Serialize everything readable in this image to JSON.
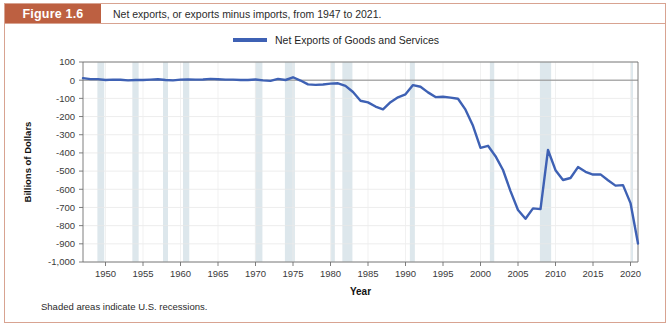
{
  "figure": {
    "tag": "Figure 1.6",
    "caption": "Net exports, or exports minus imports, from 1947 to 2021.",
    "footnote": "Shaded areas indicate U.S. recessions.",
    "tag_bg_color": "#bd6041",
    "border_color": "#d8a391"
  },
  "legend": {
    "position": "top-center",
    "entries": [
      {
        "label": "Net Exports of Goods and Services",
        "color": "#3e61b4"
      }
    ]
  },
  "chart_data": {
    "type": "line",
    "title": "Net exports, or exports minus imports, from 1947 to 2021.",
    "xlabel": "Year",
    "ylabel": "Billions of Dollars",
    "xlim": [
      1947,
      2021
    ],
    "ylim": [
      -1000,
      100
    ],
    "grid": true,
    "yticks": [
      100,
      0,
      -100,
      -200,
      -300,
      -400,
      -500,
      -600,
      -700,
      -800,
      -900,
      -1000
    ],
    "ytick_labels": [
      "100",
      "0",
      "-100",
      "-200",
      "-300",
      "-400",
      "-500",
      "-600",
      "-700",
      "-800",
      "-900",
      "-1,000"
    ],
    "xticks": [
      1950,
      1955,
      1960,
      1965,
      1970,
      1975,
      1980,
      1985,
      1990,
      1995,
      2000,
      2005,
      2010,
      2015,
      2020
    ],
    "xtick_labels": [
      "1950",
      "1955",
      "1960",
      "1965",
      "1970",
      "1975",
      "1980",
      "1985",
      "1990",
      "1995",
      "2000",
      "2005",
      "2010",
      "2015",
      "2020"
    ],
    "series": [
      {
        "name": "Net Exports of Goods and Services",
        "color": "#3e61b4",
        "x": [
          1947,
          1948,
          1949,
          1950,
          1951,
          1952,
          1953,
          1954,
          1955,
          1956,
          1957,
          1958,
          1959,
          1960,
          1961,
          1962,
          1963,
          1964,
          1965,
          1966,
          1967,
          1968,
          1969,
          1970,
          1971,
          1972,
          1973,
          1974,
          1975,
          1976,
          1977,
          1978,
          1979,
          1980,
          1981,
          1982,
          1983,
          1984,
          1985,
          1986,
          1987,
          1988,
          1989,
          1990,
          1991,
          1992,
          1993,
          1994,
          1995,
          1996,
          1997,
          1998,
          1999,
          2000,
          2001,
          2002,
          2003,
          2004,
          2005,
          2006,
          2007,
          2008,
          2009,
          2010,
          2011,
          2012,
          2013,
          2014,
          2015,
          2016,
          2017,
          2018,
          2019,
          2020,
          2021
        ],
        "y": [
          11,
          6,
          6,
          1,
          3,
          2,
          -1,
          1,
          1,
          3,
          5,
          1,
          -1,
          3,
          4,
          3,
          4,
          7,
          5,
          3,
          3,
          1,
          1,
          4,
          -1,
          -4,
          7,
          1,
          16,
          -2,
          -23,
          -26,
          -24,
          -19,
          -17,
          -31,
          -65,
          -113,
          -122,
          -145,
          -160,
          -121,
          -94,
          -78,
          -27,
          -36,
          -67,
          -93,
          -91,
          -96,
          -102,
          -162,
          -251,
          -372,
          -361,
          -418,
          -494,
          -610,
          -714,
          -762,
          -705,
          -709,
          -384,
          -495,
          -549,
          -538,
          -478,
          -504,
          -519,
          -518,
          -550,
          -580,
          -577,
          -676,
          -898
        ]
      }
    ],
    "recession_bands": [
      [
        1948.92,
        1949.83
      ],
      [
        1953.58,
        1954.42
      ],
      [
        1957.67,
        1958.33
      ],
      [
        1960.33,
        1961.17
      ],
      [
        1969.92,
        1970.92
      ],
      [
        1973.92,
        1975.25
      ],
      [
        1980.08,
        1980.58
      ],
      [
        1981.58,
        1982.92
      ],
      [
        1990.58,
        1991.25
      ],
      [
        2001.25,
        2001.83
      ],
      [
        2007.92,
        2009.42
      ],
      [
        2020.08,
        2020.33
      ]
    ],
    "recession_band_color": "#dde7ec",
    "annotations": [
      "Shaded areas indicate U.S. recessions."
    ]
  }
}
